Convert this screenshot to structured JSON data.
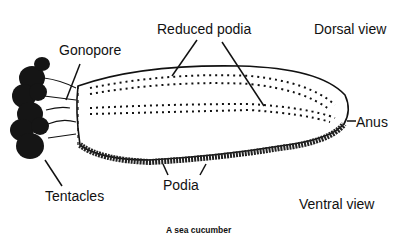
{
  "diagram": {
    "title": "A sea cucumber",
    "views": {
      "dorsal": "Dorsal view",
      "ventral": "Ventral view"
    },
    "labels": {
      "gonopore": "Gonopore",
      "reduced_podia": "Reduced podia",
      "anus": "Anus",
      "tentacles": "Tentacles",
      "podia": "Podia"
    },
    "colors": {
      "ink": "#111111",
      "background": "#ffffff"
    }
  }
}
